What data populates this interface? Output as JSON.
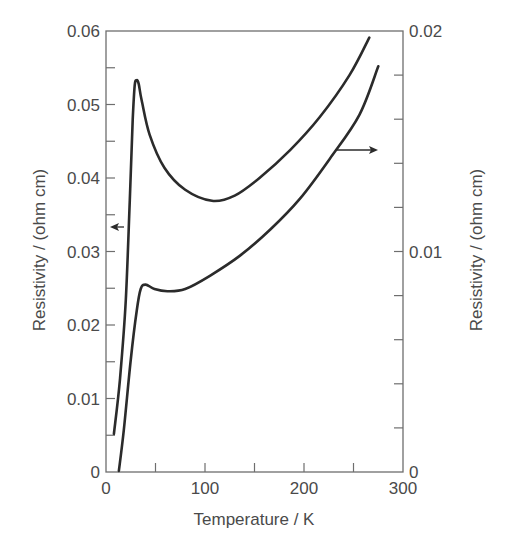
{
  "chart_data": {
    "type": "line",
    "title": "",
    "xlabel": "Temperature / K",
    "ylabel_left": "Resistivity / (ohm cm)",
    "ylabel_right": "Resistivity / (ohm cm)",
    "xlim": [
      0,
      300
    ],
    "ylim_left": [
      0,
      0.06
    ],
    "ylim_right": [
      0,
      0.02
    ],
    "x_ticks": [
      "0",
      "100",
      "200",
      "300"
    ],
    "y_ticks_left": [
      "0",
      "0.01",
      "0.02",
      "0.03",
      "0.04",
      "0.05",
      "0.06"
    ],
    "y_ticks_right": [
      "0",
      "0.01",
      "0.02"
    ],
    "grid": false,
    "legend": "none; arrows indicate axis for each curve",
    "annotations": [
      {
        "type": "arrow",
        "direction": "left",
        "meaning": "upper curve uses left axis"
      },
      {
        "type": "arrow",
        "direction": "right",
        "meaning": "lower curve uses right axis"
      }
    ],
    "series": [
      {
        "name": "upper curve (left axis)",
        "axis": "left",
        "x": [
          8,
          14,
          20,
          24,
          27,
          29,
          31,
          33,
          36,
          44,
          59,
          80,
          107,
          130,
          155,
          186,
          216,
          246,
          266
        ],
        "y": [
          0.0052,
          0.0125,
          0.0234,
          0.037,
          0.0479,
          0.0526,
          0.0533,
          0.0528,
          0.0506,
          0.0459,
          0.0414,
          0.0384,
          0.0369,
          0.0376,
          0.04,
          0.0438,
          0.0483,
          0.054,
          0.0591
        ]
      },
      {
        "name": "lower curve (right axis)",
        "axis": "right",
        "x": [
          13,
          18,
          25,
          31,
          35,
          40,
          49,
          62,
          80,
          105,
          135,
          166,
          196,
          226,
          256,
          275
        ],
        "y": [
          5e-05,
          0.0019,
          0.0051,
          0.0073,
          0.0083,
          0.0085,
          0.0083,
          0.0082,
          0.0083,
          0.0089,
          0.0098,
          0.011,
          0.0124,
          0.0142,
          0.0162,
          0.0184
        ]
      }
    ]
  },
  "colors": {
    "axis": "#6e6e6e",
    "curve": "#2b2b2b",
    "text": "#4a4a4a"
  }
}
